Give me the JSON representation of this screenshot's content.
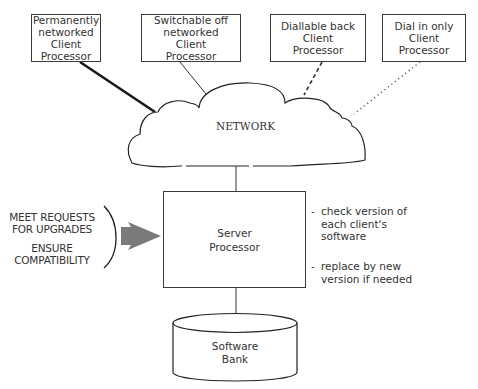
{
  "clients": [
    {
      "lines": [
        "Permanently",
        "networked",
        "Client",
        "Processor"
      ],
      "connection": "thick-solid"
    },
    {
      "lines": [
        "Switchable off",
        "networked",
        "Client",
        "Processor"
      ],
      "connection": "thin-solid"
    },
    {
      "lines": [
        "Diallable back",
        "Client",
        "Processor"
      ],
      "connection": "dashed"
    },
    {
      "lines": [
        "Dial in only",
        "Client",
        "Processor"
      ],
      "connection": "dotted"
    }
  ],
  "network": {
    "label": "NETWORK"
  },
  "server": {
    "lines": [
      "Server",
      "Processor"
    ]
  },
  "inputs": {
    "line1": "MEET REQUESTS",
    "line2": "FOR UPGRADES",
    "line3": "ENSURE",
    "line4": "COMPATIBILITY"
  },
  "tasks": [
    {
      "bullet": "-",
      "lines": [
        "check version of",
        "each client's",
        "software"
      ]
    },
    {
      "bullet": "-",
      "lines": [
        "replace by new",
        "version if needed"
      ]
    }
  ],
  "software_bank": {
    "lines": [
      "Software",
      "Bank"
    ]
  },
  "colors": {
    "line": "#2a2a2a",
    "arrow": "#7a7a7a",
    "text": "#333333"
  }
}
